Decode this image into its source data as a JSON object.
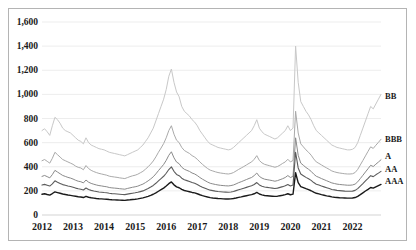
{
  "chart_data": {
    "type": "line",
    "title": "",
    "xlabel": "",
    "ylabel": "",
    "ylim": [
      0,
      1600
    ],
    "yticks": [
      0,
      200,
      400,
      600,
      800,
      1000,
      1200,
      1400,
      1600
    ],
    "ytick_labels": [
      "0",
      "200",
      "400",
      "600",
      "800",
      "1,000",
      "1,200",
      "1,400",
      "1,600"
    ],
    "xlim": [
      "2012",
      "2023"
    ],
    "xtick_labels": [
      "2012",
      "2013",
      "2014",
      "2015",
      "2016",
      "2017",
      "2018",
      "2019",
      "2020",
      "2021",
      "2022"
    ],
    "grid": true,
    "grid_axis": "y",
    "legend_position": "right-inline",
    "x_start_year": 2012,
    "x_points_per_year": 12,
    "series": [
      {
        "name": "BB",
        "label": "BB",
        "color": "#c8c8c8",
        "width": 1.0,
        "label_y_value": 980,
        "values": [
          700,
          715,
          690,
          660,
          740,
          810,
          790,
          760,
          720,
          700,
          690,
          680,
          660,
          640,
          620,
          610,
          590,
          640,
          600,
          580,
          570,
          560,
          550,
          545,
          540,
          530,
          520,
          515,
          510,
          505,
          500,
          495,
          490,
          500,
          510,
          520,
          530,
          540,
          560,
          580,
          610,
          640,
          680,
          720,
          780,
          840,
          900,
          960,
          1040,
          1150,
          1210,
          1100,
          1020,
          980,
          900,
          860,
          840,
          820,
          790,
          770,
          740,
          700,
          670,
          640,
          610,
          590,
          580,
          570,
          560,
          555,
          550,
          545,
          540,
          545,
          560,
          580,
          600,
          620,
          640,
          660,
          680,
          700,
          740,
          790,
          720,
          690,
          670,
          660,
          650,
          640,
          630,
          640,
          660,
          680,
          700,
          740,
          700,
          720,
          1400,
          1100,
          940,
          900,
          860,
          830,
          790,
          740,
          700,
          680,
          660,
          640,
          620,
          600,
          580,
          570,
          560,
          555,
          550,
          545,
          540,
          540,
          545,
          560,
          600,
          660,
          720,
          780,
          840,
          900,
          880,
          920,
          960,
          1000
        ]
      },
      {
        "name": "BBB",
        "label": "BBB",
        "color": "#aaaaaa",
        "width": 1.0,
        "label_y_value": 620,
        "values": [
          450,
          460,
          445,
          430,
          470,
          520,
          500,
          480,
          460,
          450,
          440,
          430,
          420,
          405,
          395,
          390,
          375,
          410,
          385,
          370,
          360,
          352,
          345,
          340,
          335,
          330,
          322,
          318,
          315,
          312,
          308,
          305,
          302,
          310,
          318,
          325,
          330,
          338,
          350,
          362,
          380,
          400,
          422,
          448,
          482,
          520,
          555,
          592,
          640,
          700,
          740,
          670,
          620,
          600,
          560,
          535,
          522,
          510,
          492,
          480,
          462,
          440,
          420,
          402,
          385,
          372,
          365,
          358,
          352,
          348,
          345,
          342,
          340,
          344,
          352,
          365,
          378,
          390,
          402,
          415,
          428,
          440,
          462,
          492,
          452,
          432,
          420,
          414,
          408,
          402,
          396,
          402,
          414,
          428,
          440,
          462,
          440,
          452,
          860,
          680,
          590,
          565,
          540,
          520,
          496,
          465,
          440,
          428,
          415,
          402,
          390,
          378,
          365,
          358,
          352,
          348,
          345,
          342,
          340,
          340,
          342,
          352,
          378,
          415,
          452,
          490,
          528,
          565,
          552,
          578,
          602,
          628
        ]
      },
      {
        "name": "A",
        "label": "A",
        "color": "#8a8a8a",
        "width": 1.0,
        "label_y_value": 480,
        "values": [
          320,
          328,
          318,
          308,
          335,
          370,
          356,
          342,
          328,
          320,
          312,
          306,
          298,
          288,
          280,
          276,
          266,
          290,
          272,
          262,
          255,
          249,
          244,
          241,
          237,
          234,
          228,
          225,
          223,
          221,
          218,
          216,
          214,
          220,
          225,
          230,
          234,
          239,
          248,
          256,
          269,
          283,
          299,
          317,
          341,
          368,
          393,
          419,
          453,
          495,
          524,
          474,
          439,
          425,
          396,
          379,
          370,
          361,
          348,
          340,
          327,
          311,
          297,
          285,
          273,
          263,
          258,
          253,
          249,
          246,
          244,
          242,
          241,
          244,
          249,
          258,
          268,
          276,
          285,
          294,
          303,
          311,
          327,
          348,
          320,
          306,
          297,
          293,
          289,
          285,
          280,
          285,
          293,
          301,
          311,
          327,
          311,
          320,
          640,
          495,
          430,
          412,
          394,
          379,
          362,
          339,
          321,
          312,
          302,
          293,
          284,
          275,
          266,
          261,
          256,
          253,
          251,
          249,
          247,
          247,
          249,
          256,
          275,
          302,
          329,
          357,
          384,
          412,
          402,
          421,
          439,
          458
        ]
      },
      {
        "name": "AA",
        "label": "AA",
        "color": "#5c5c5c",
        "width": 1.1,
        "label_y_value": 370,
        "values": [
          248,
          254,
          247,
          240,
          258,
          283,
          272,
          262,
          252,
          246,
          240,
          236,
          230,
          223,
          217,
          214,
          207,
          224,
          211,
          204,
          199,
          195,
          191,
          189,
          186,
          184,
          180,
          177,
          176,
          174,
          172,
          170,
          169,
          173,
          177,
          181,
          184,
          188,
          194,
          200,
          210,
          220,
          232,
          245,
          263,
          283,
          302,
          321,
          346,
          377,
          399,
          362,
          336,
          326,
          305,
          292,
          285,
          278,
          269,
          263,
          253,
          241,
          231,
          222,
          213,
          206,
          202,
          198,
          195,
          193,
          191,
          190,
          189,
          191,
          195,
          202,
          209,
          215,
          222,
          229,
          236,
          242,
          253,
          269,
          249,
          239,
          232,
          229,
          226,
          223,
          220,
          223,
          229,
          235,
          242,
          253,
          241,
          248,
          520,
          390,
          340,
          326,
          312,
          300,
          287,
          269,
          255,
          248,
          240,
          233,
          226,
          219,
          212,
          208,
          204,
          202,
          200,
          198,
          197,
          197,
          198,
          204,
          219,
          240,
          261,
          283,
          304,
          326,
          318,
          333,
          347,
          362
        ]
      },
      {
        "name": "AAA",
        "label": "AAA",
        "color": "#1a1a1a",
        "width": 1.4,
        "label_y_value": 270,
        "values": [
          172,
          176,
          170,
          165,
          178,
          192,
          186,
          180,
          174,
          170,
          166,
          163,
          159,
          155,
          151,
          149,
          145,
          155,
          147,
          143,
          140,
          137,
          135,
          134,
          132,
          131,
          128,
          126,
          125,
          124,
          123,
          122,
          121,
          124,
          126,
          129,
          131,
          134,
          138,
          142,
          148,
          155,
          163,
          172,
          184,
          197,
          210,
          223,
          240,
          260,
          274,
          250,
          233,
          226,
          212,
          203,
          198,
          193,
          187,
          183,
          176,
          168,
          161,
          155,
          149,
          144,
          141,
          139,
          137,
          136,
          134,
          133,
          133,
          134,
          137,
          141,
          146,
          150,
          155,
          160,
          165,
          169,
          176,
          187,
          174,
          167,
          162,
          160,
          158,
          156,
          154,
          156,
          160,
          164,
          169,
          176,
          168,
          173,
          350,
          268,
          236,
          227,
          218,
          210,
          201,
          189,
          180,
          175,
          169,
          164,
          159,
          155,
          150,
          147,
          145,
          143,
          142,
          141,
          140,
          140,
          141,
          145,
          155,
          169,
          184,
          199,
          213,
          228,
          223,
          233,
          243,
          253
        ]
      }
    ]
  },
  "frame": {
    "border_color": "#b4b4b4",
    "background": "#ffffff",
    "gridline_color": "#e8e8e8"
  }
}
